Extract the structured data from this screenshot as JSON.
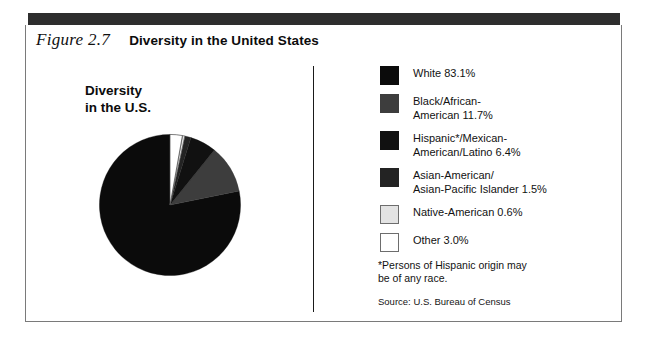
{
  "figure": {
    "number": "Figure 2.7",
    "title": "Diversity in the United States"
  },
  "pie": {
    "title": "Diversity\nin the U.S."
  },
  "legend": {
    "footnote": "*Persons of Hispanic origin may\n be of any race.",
    "source": "Source: U.S. Bureau of Census",
    "items": [
      {
        "label": "White 83.1%",
        "color": "#0b0b0b"
      },
      {
        "label": "Black/African-\nAmerican 11.7%",
        "color": "#3d3d3d"
      },
      {
        "label": "Hispanic*/Mexican-\nAmerican/Latino 6.4%",
        "color": "#111111"
      },
      {
        "label": "Asian-American/\nAsian-Pacific Islander 1.5%",
        "color": "#232323"
      },
      {
        "label": "Native-American 0.6%",
        "color": "#e3e3e3"
      },
      {
        "label": "Other 3.0%",
        "color": "#ffffff"
      }
    ]
  },
  "chart_data": {
    "type": "pie",
    "title": "Diversity in the U.S.",
    "unit": "percent",
    "start_angle_deg": 0,
    "direction": "counterclockwise",
    "legend_position": "right",
    "note": "Percentages total more than 100 because persons of Hispanic origin may be of any race.",
    "categories": [
      "White",
      "Black/African-American",
      "Hispanic*/Mexican-American/Latino",
      "Asian-American/Asian-Pacific Islander",
      "Native-American",
      "Other"
    ],
    "values": [
      83.1,
      11.7,
      6.4,
      1.5,
      0.6,
      3.0
    ],
    "colors": [
      "#0b0b0b",
      "#3d3d3d",
      "#111111",
      "#232323",
      "#e3e3e3",
      "#ffffff"
    ],
    "slices": [
      {
        "label": "White",
        "value": 83.1,
        "color": "#0b0b0b"
      },
      {
        "label": "Black/African-American",
        "value": 11.7,
        "color": "#3d3d3d"
      },
      {
        "label": "Hispanic*/Mexican-American/Latino",
        "value": 6.4,
        "color": "#111111"
      },
      {
        "label": "Asian-American/Asian-Pacific Islander",
        "value": 1.5,
        "color": "#232323"
      },
      {
        "label": "Native-American",
        "value": 0.6,
        "color": "#e3e3e3"
      },
      {
        "label": "Other",
        "value": 3.0,
        "color": "#ffffff"
      }
    ]
  }
}
